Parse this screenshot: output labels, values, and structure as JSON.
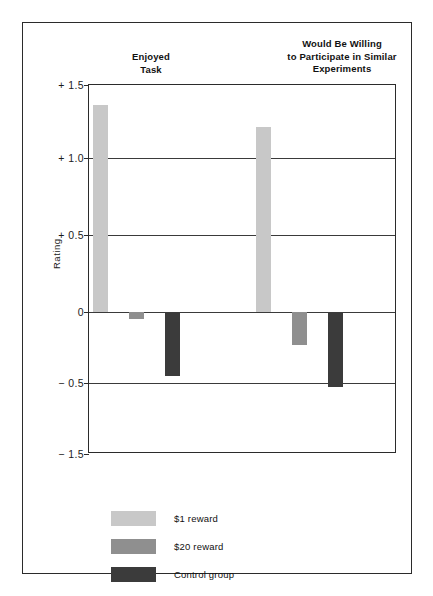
{
  "figure": {
    "y_axis_title": "Rating"
  },
  "chart_data": {
    "type": "bar",
    "title": "",
    "subtitle": "",
    "xlabel": "",
    "ylabel": "Rating",
    "ylim": [
      -1.5,
      1.5
    ],
    "grid": true,
    "grid_axis": "y",
    "legend_position": "bottom-left",
    "categories": [
      "Enjoyed\nTask",
      "Would Be Willing\nto Participate in Similar\nExperiments"
    ],
    "category_labels": [
      [
        "Enjoyed",
        "Task"
      ],
      [
        "Would Be Willing",
        "to Participate in Similar",
        "Experiments"
      ]
    ],
    "series": [
      {
        "name": "$1 reward",
        "color": "#c8c8c8",
        "values": [
          1.36,
          1.21
        ]
      },
      {
        "name": "$20 reward",
        "color": "#8f8f8f",
        "values": [
          -0.05,
          -0.23
        ]
      },
      {
        "name": "Control group",
        "color": "#3b3b3b",
        "values": [
          -0.45,
          -0.56
        ]
      }
    ],
    "ytick_values": [
      1.5,
      1.0,
      0.5,
      0,
      -0.5,
      -1.5
    ],
    "ytick_labels": [
      "+ 1.5",
      "+ 1.0",
      "+ 0.5",
      "0",
      "− 0.5",
      "− 1.5"
    ],
    "ytick_pixel_fraction": [
      0.0,
      0.198,
      0.407,
      0.615,
      0.807,
      1.0
    ],
    "gridline_values": [
      1.0,
      0.5,
      0,
      -0.5
    ],
    "baseline_value": 0
  },
  "legend": {
    "items": [
      {
        "label": "$1 reward",
        "color": "#c8c8c8"
      },
      {
        "label": "$20 reward",
        "color": "#8f8f8f"
      },
      {
        "label": "Control group",
        "color": "#3b3b3b"
      }
    ]
  },
  "colors": {
    "frame": "#2b2b2b",
    "gridline": "#3a3a3a",
    "background": "#ffffff",
    "text": "#1b1b1b"
  }
}
